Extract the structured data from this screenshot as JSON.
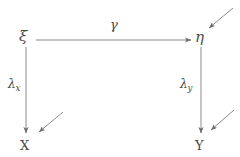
{
  "diagram": {
    "type": "path-diagram",
    "title": "",
    "background_color": "#ffffff",
    "stroke_color": "#7a7a7a",
    "text_color": "#4a4a4a",
    "nodes": [
      {
        "id": "xi",
        "label": "ξ",
        "role": "latent-exogenous",
        "x": 26,
        "y": 38
      },
      {
        "id": "eta",
        "label": "η",
        "role": "latent-endogenous",
        "x": 201,
        "y": 38
      },
      {
        "id": "X",
        "label": "X",
        "role": "observed-indicator",
        "x": 26,
        "y": 145
      },
      {
        "id": "Y",
        "label": "Y",
        "role": "observed-indicator",
        "x": 201,
        "y": 145
      }
    ],
    "edges": [
      {
        "id": "gamma",
        "label": "γ",
        "from": "xi",
        "to": "eta",
        "orientation": "horizontal"
      },
      {
        "id": "lambda_x",
        "label": "λ",
        "subscript": "x",
        "from": "xi",
        "to": "X",
        "orientation": "vertical"
      },
      {
        "id": "lambda_y",
        "label": "λ",
        "subscript": "y",
        "from": "eta",
        "to": "Y",
        "orientation": "vertical"
      }
    ],
    "error_arrows": [
      {
        "id": "zeta-eta",
        "target": "eta",
        "direction": "down-left"
      },
      {
        "id": "delta-x",
        "target": "X",
        "direction": "down-left"
      },
      {
        "id": "epsilon-y",
        "target": "Y",
        "direction": "down-left"
      }
    ]
  }
}
